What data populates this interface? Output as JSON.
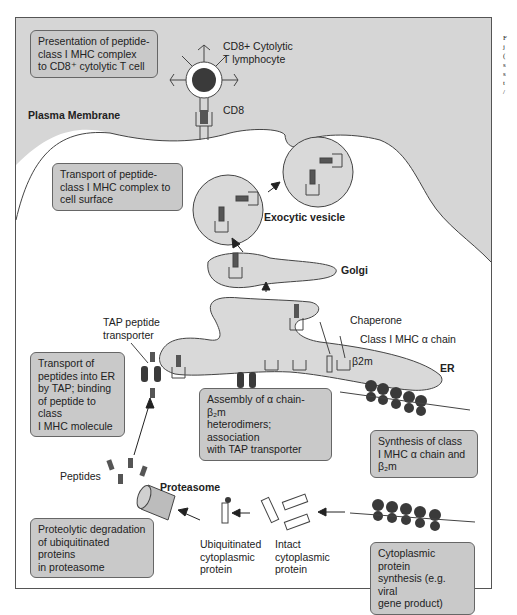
{
  "figure": {
    "steps": [
      {
        "id": "presentation",
        "text": "Presentation of peptide-class I MHC complex to CD8+ cytolytic T cell"
      },
      {
        "id": "transport-surface",
        "text": "Transport of peptide-class I MHC complex to cell surface"
      },
      {
        "id": "tap-transport",
        "text": "Transport of peptides into ER by TAP; binding of peptide to class I MHC molecule"
      },
      {
        "id": "assembly",
        "text": "Assembly of α chain- β2m heterodimers; association with TAP transporter"
      },
      {
        "id": "synthesis-mhc",
        "text": "Synthesis of class I MHC α chain and β2m"
      },
      {
        "id": "degradation",
        "text": "Proteolytic degradation of ubiquitinated proteins in proteasome"
      },
      {
        "id": "cytoplasmic-synthesis",
        "text": "Cytoplasmic protein synthesis (e.g. viral gene product)"
      }
    ],
    "labels": {
      "t_cell_line1": "CD8+ Cytolytic",
      "t_cell_line2": "T lymphocyte",
      "cd8": "CD8",
      "plasma_membrane": "Plasma Membrane",
      "exocytic_vesicle": "Exocytic vesicle",
      "golgi": "Golgi",
      "tap_line1": "TAP peptide",
      "tap_line2": "transporter",
      "chaperone": "Chaperone",
      "mhc_chain": "Class I MHC α chain",
      "b2m": "β2m",
      "er": "ER",
      "peptides": "Peptides",
      "proteasome": "Proteasome",
      "ubiq_line1": "Ubiquitinated",
      "ubiq_line2": "cytoplasmic",
      "ubiq_line3": "protein",
      "intact_line1": "Intact",
      "intact_line2": "cytoplasmic",
      "intact_line3": "protein"
    },
    "box_lines": {
      "presentation": [
        "Presentation of peptide-",
        "class I MHC complex",
        "to CD8⁺ cytolytic T cell"
      ],
      "transport_surface": [
        "Transport of peptide-",
        "class I MHC complex to",
        "cell surface"
      ],
      "tap_transport": [
        "Transport of",
        "peptides into ER",
        "by TAP; binding",
        "of peptide to class",
        "I MHC molecule"
      ],
      "assembly": [
        "Assembly of α chain- β₂m",
        "heterodimers; association",
        "with TAP transporter"
      ],
      "synthesis_mhc": [
        "Synthesis of class",
        "I MHC α chain and",
        "β₂m"
      ],
      "degradation": [
        "Proteolytic degradation",
        "of ubiquitinated proteins",
        "in proteasome"
      ],
      "cytoplasmic_synthesis": [
        "Cytoplasmic protein",
        "synthesis (e.g. viral",
        "gene product)"
      ]
    },
    "side_text": [
      "F",
      "j",
      "(",
      "s",
      "s",
      "t",
      "/"
    ],
    "colors": {
      "extracellular": "#d6d6d6",
      "organelle": "#d9d9d9",
      "box": "#c9c9c9",
      "dark": "#3a3a3a",
      "line": "#444444"
    }
  }
}
